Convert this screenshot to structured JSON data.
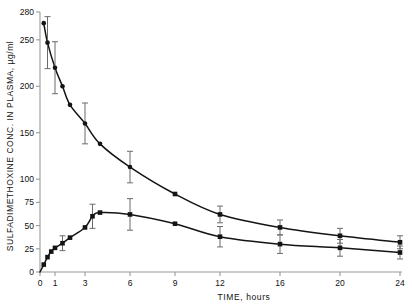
{
  "chart_data": {
    "type": "line",
    "title": "",
    "xlabel": "TIME, hours",
    "ylabel": "SULFADIMETHOXINE CONC. IN PLASMA, µg/ml",
    "xlim": [
      0,
      24
    ],
    "ylim": [
      0,
      280
    ],
    "grid": false,
    "legend": "none",
    "xticks": [
      0,
      1,
      3,
      6,
      9,
      12,
      16,
      20,
      24
    ],
    "xtick_labels": [
      "0",
      "1",
      "3",
      "6",
      "9",
      "12",
      "16",
      "20",
      "24"
    ],
    "yticks": [
      0,
      25,
      50,
      75,
      100,
      150,
      200,
      250,
      280
    ],
    "ytick_labels": [
      "0",
      "25",
      "50",
      "75",
      "100",
      "150",
      "200",
      "250",
      "280"
    ],
    "series": [
      {
        "name": "upper-curve",
        "marker": "circle-square",
        "x": [
          0.25,
          0.5,
          1.0,
          1.5,
          2.0,
          3.0,
          4.0,
          6.0,
          9.0,
          12.0,
          16.0,
          20.0,
          24.0
        ],
        "values": [
          268,
          247,
          220,
          200,
          180,
          160,
          138,
          113,
          84,
          62,
          48,
          39,
          32
        ],
        "errors": [
          null,
          28,
          28,
          null,
          null,
          22,
          null,
          17,
          null,
          9,
          8,
          8,
          7
        ]
      },
      {
        "name": "lower-curve",
        "marker": "square",
        "x": [
          0.25,
          0.5,
          0.75,
          1.0,
          1.5,
          2.0,
          3.0,
          3.5,
          4.0,
          6.0,
          9.0,
          12.0,
          16.0,
          20.0,
          24.0
        ],
        "values": [
          8,
          16,
          22,
          26,
          31,
          37,
          48,
          60,
          64,
          62,
          52,
          38,
          30,
          26,
          21
        ],
        "errors": [
          null,
          null,
          null,
          null,
          8,
          null,
          null,
          13,
          null,
          17,
          null,
          11,
          10,
          9,
          7
        ]
      }
    ],
    "annotations": []
  },
  "colors": {
    "axis": "#9a9a9a",
    "curve": "#141414",
    "marker": "#141414",
    "errorbar": "#6b6b6b",
    "background": "#ffffff",
    "text": "#141414"
  }
}
